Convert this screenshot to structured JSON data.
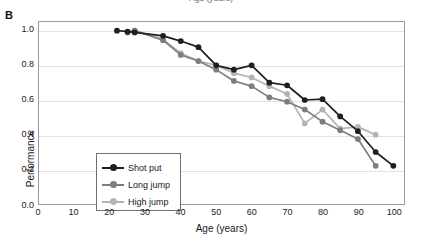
{
  "figure": {
    "panel_label": "B",
    "cropped_upper_axis_title": "Age (years)"
  },
  "legend": {
    "position": "inside-lower-left",
    "entries": [
      {
        "label": "Shot put",
        "color": "#1f1f1f"
      },
      {
        "label": "Long jump",
        "color": "#7d7d7d"
      },
      {
        "label": "High jump",
        "color": "#b4b4b4"
      }
    ]
  },
  "axis": {
    "xlabel": "Age (years)",
    "ylabel": "Performance",
    "xticks": [
      "0",
      "10",
      "20",
      "30",
      "40",
      "50",
      "60",
      "70",
      "80",
      "90",
      "100"
    ],
    "yticks": [
      "0.0",
      "0.2",
      "0.4",
      "0.6",
      "0.8",
      "1.0"
    ]
  },
  "chart_data": {
    "type": "line",
    "title": "",
    "xlabel": "Age (years)",
    "ylabel": "Performance",
    "xlim": [
      0,
      103
    ],
    "ylim": [
      0.0,
      1.05
    ],
    "xticks": [
      0,
      10,
      20,
      30,
      40,
      50,
      60,
      70,
      80,
      90,
      100
    ],
    "yticks": [
      0.0,
      0.2,
      0.4,
      0.6,
      0.8,
      1.0
    ],
    "grid": "horizontal",
    "legend_position": "lower left (inside axes)",
    "series": [
      {
        "name": "Shot put",
        "color": "#1f1f1f",
        "marker": "circle",
        "x": [
          22,
          25,
          27,
          35,
          40,
          45,
          50,
          55,
          60,
          65,
          70,
          75,
          80,
          85,
          90,
          95,
          100
        ],
        "y": [
          1.0,
          0.995,
          0.99,
          0.97,
          0.94,
          0.905,
          0.8,
          0.775,
          0.8,
          0.7,
          0.685,
          0.6,
          0.605,
          0.505,
          0.42,
          0.3,
          0.22
        ]
      },
      {
        "name": "Long jump",
        "color": "#7d7d7d",
        "marker": "circle",
        "x": [
          25,
          27,
          35,
          40,
          45,
          50,
          55,
          60,
          65,
          70,
          75,
          80,
          85,
          90,
          95
        ],
        "y": [
          0.99,
          1.0,
          0.945,
          0.86,
          0.825,
          0.775,
          0.71,
          0.68,
          0.615,
          0.59,
          0.545,
          0.475,
          0.425,
          0.375,
          0.22
        ]
      },
      {
        "name": "High jump",
        "color": "#b4b4b4",
        "marker": "circle",
        "x": [
          25,
          27,
          35,
          40,
          45,
          50,
          55,
          60,
          65,
          70,
          75,
          80,
          85,
          90,
          95
        ],
        "y": [
          0.99,
          1.0,
          0.95,
          0.87,
          0.825,
          0.8,
          0.755,
          0.73,
          0.68,
          0.635,
          0.465,
          0.545,
          0.435,
          0.445,
          0.4
        ]
      }
    ]
  }
}
